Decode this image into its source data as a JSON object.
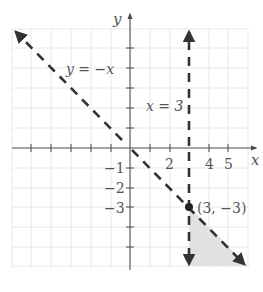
{
  "figure": {
    "axis_labels": {
      "x": "x",
      "y": "y"
    },
    "x_tick_labels": [
      {
        "value": 2,
        "text": "2"
      },
      {
        "value": 4,
        "text": "4"
      },
      {
        "value": 5,
        "text": "5"
      }
    ],
    "y_tick_labels": [
      {
        "value": -1,
        "text": "−1"
      },
      {
        "value": -2,
        "text": "−2"
      },
      {
        "value": -3,
        "text": "−3"
      }
    ],
    "x_range": [
      -6,
      6
    ],
    "y_range": [
      -6,
      6
    ],
    "lines": [
      {
        "label": "y = −x",
        "equation": "y = -x",
        "style": "dashed"
      },
      {
        "label": "x = 3",
        "equation": "x = 3",
        "style": "dashed"
      }
    ],
    "point": {
      "label": "(3, −3)",
      "x": 3,
      "y": -3
    },
    "shaded_region": {
      "description": "Region where x > 3 and y < −x",
      "vertices": [
        [
          3,
          -3
        ],
        [
          3,
          -6
        ],
        [
          6,
          -6
        ]
      ],
      "color": "#d9d9d9"
    },
    "colors": {
      "line": "#333333",
      "axis": "#4a4a4a",
      "grid": "#e2e2e2",
      "shade": "#d9d9d9"
    }
  }
}
